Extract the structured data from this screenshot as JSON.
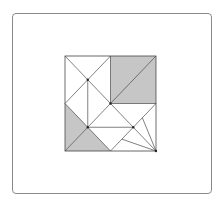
{
  "diagram": {
    "type": "geometric-dissection",
    "grid": 4,
    "colors": {
      "line": "#4a4a4a",
      "shade": "#c6c6c6",
      "fill": "#ffffff",
      "frame": "#8a8a8a"
    },
    "shaded_regions": [
      {
        "name": "top-right-square",
        "points": [
          [
            2,
            0
          ],
          [
            4,
            0
          ],
          [
            4,
            2
          ],
          [
            2,
            2
          ]
        ]
      },
      {
        "name": "left-triangle",
        "points": [
          [
            0,
            2
          ],
          [
            1,
            3
          ],
          [
            0,
            4
          ]
        ]
      },
      {
        "name": "bottom-left-triangle",
        "points": [
          [
            0,
            4
          ],
          [
            1,
            3
          ],
          [
            2,
            4
          ]
        ]
      }
    ],
    "lines": [
      [
        [
          0,
          0
        ],
        [
          2,
          2
        ]
      ],
      [
        [
          2,
          0
        ],
        [
          0,
          2
        ]
      ],
      [
        [
          2,
          0
        ],
        [
          2,
          2
        ]
      ],
      [
        [
          2,
          2
        ],
        [
          4,
          0
        ]
      ],
      [
        [
          2,
          2
        ],
        [
          4,
          2
        ]
      ],
      [
        [
          1,
          1
        ],
        [
          1,
          3
        ]
      ],
      [
        [
          0,
          2
        ],
        [
          2,
          4
        ]
      ],
      [
        [
          2,
          2
        ],
        [
          0,
          4
        ]
      ],
      [
        [
          2,
          2
        ],
        [
          4,
          4
        ]
      ],
      [
        [
          4,
          2
        ],
        [
          2,
          4
        ]
      ],
      [
        [
          1,
          3
        ],
        [
          3,
          3
        ]
      ],
      [
        [
          4,
          4
        ],
        [
          3.4,
          2.6
        ]
      ],
      [
        [
          4,
          4
        ],
        [
          2.5,
          3.5
        ]
      ]
    ],
    "points": [
      {
        "name": "p-upper-left",
        "at": [
          1,
          1
        ]
      },
      {
        "name": "p-center",
        "at": [
          2,
          2
        ]
      },
      {
        "name": "p-lower-left",
        "at": [
          1,
          3
        ]
      },
      {
        "name": "p-lower-right",
        "at": [
          3,
          3
        ]
      },
      {
        "name": "p-corner-bottom-right",
        "at": [
          4,
          4
        ]
      }
    ]
  }
}
